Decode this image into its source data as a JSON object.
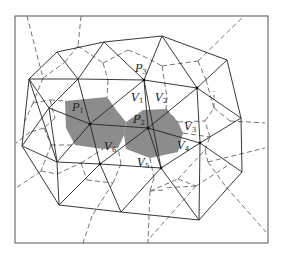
{
  "diagram": {
    "type": "delaunay-voronoi",
    "labels": {
      "P1": "P",
      "P1_sub": "1",
      "P2": "P",
      "P2_sub": "2",
      "P3": "P",
      "P3_sub": "3",
      "V1": "V",
      "V1_sub": "1",
      "V2": "V",
      "V2_sub": "2",
      "V3": "V",
      "V3_sub": "3",
      "V4": "V",
      "V4_sub": "4",
      "V5": "V",
      "V5_sub": "5",
      "V6": "V",
      "V6_sub": "6"
    },
    "colors": {
      "shaded_cells": "#8c8c8c",
      "triangulation_edges": "#222222",
      "voronoi_edges": "#666666"
    }
  }
}
